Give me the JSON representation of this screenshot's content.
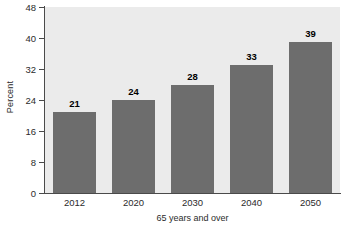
{
  "chart_data": {
    "type": "bar",
    "title": "",
    "xlabel": "65 years and over",
    "ylabel": "Percent",
    "categories": [
      "2012",
      "2020",
      "2030",
      "2040",
      "2050"
    ],
    "values": [
      21,
      24,
      28,
      33,
      39
    ],
    "value_labels": [
      "21",
      "24",
      "28",
      "33",
      "39"
    ],
    "ylim": [
      0,
      48
    ],
    "yticks": [
      0,
      8,
      16,
      24,
      32,
      40,
      48
    ],
    "ytick_labels": [
      "0",
      "8",
      "16",
      "24",
      "32",
      "40",
      "48"
    ],
    "grid": false,
    "legend": false,
    "bar_color": "#6d6d6d",
    "plot_background": "#ebebeb",
    "axis_color": "#4a4a4a",
    "text_color": "#2b2b2b"
  }
}
